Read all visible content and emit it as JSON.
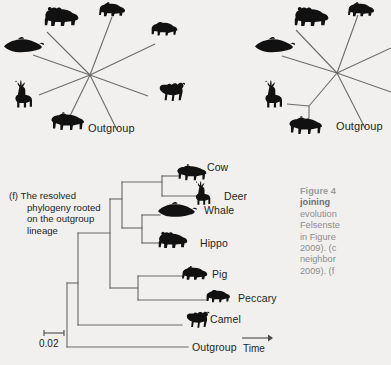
{
  "figure": {
    "background_color": "#f1f0ee",
    "line_color": "#6b6b6b",
    "silhouette_color": "#111111"
  },
  "panel_e_left": {
    "name": "unresolved-star-phylogeny",
    "outgroup_label": "Outgroup",
    "taxa": [
      "Hippo",
      "Pig",
      "Peccary",
      "Camel",
      "Cow",
      "Deer",
      "Whale",
      "Outgroup"
    ]
  },
  "panel_e_right": {
    "name": "partially-resolved-star-phylogeny",
    "outgroup_label": "Outgroup",
    "taxa": [
      "Hippo",
      "Pig",
      "Peccary",
      "Camel",
      "Cow",
      "Deer",
      "Whale",
      "Outgroup"
    ]
  },
  "panel_f": {
    "caption_lines": [
      "(f) The resolved",
      "phylogeny rooted",
      "on the outgroup",
      "lineage"
    ],
    "tips": [
      {
        "label": "Cow",
        "icon": "cow-silhouette"
      },
      {
        "label": "Deer",
        "icon": "deer-silhouette"
      },
      {
        "label": "Whale",
        "icon": "whale-silhouette"
      },
      {
        "label": "Hippo",
        "icon": "hippo-silhouette"
      },
      {
        "label": "Pig",
        "icon": "pig-silhouette"
      },
      {
        "label": "Peccary",
        "icon": "peccary-silhouette"
      },
      {
        "label": "Camel",
        "icon": "camel-silhouette"
      },
      {
        "label": "Outgroup",
        "icon": "none"
      }
    ],
    "scale_bar_value": "0.02",
    "time_axis_label": "Time"
  },
  "figure_caption": {
    "lines": [
      "Figure 4",
      "joining",
      "evolution",
      "Felsenste",
      "in Figure",
      "2009). (c",
      "neighbor",
      "2009). (f"
    ],
    "bold_line_index": 1
  }
}
